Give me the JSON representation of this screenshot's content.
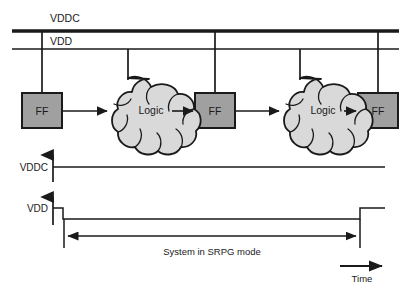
{
  "figure": {
    "colors": {
      "background": "#ffffff",
      "line": "#1a1a1a",
      "ff_fill": "#a0a0a0",
      "logic_fill": "#d9d9d9",
      "text": "#1a1a1a"
    }
  },
  "schematic": {
    "rails": [
      {
        "id": "vddc",
        "label": "VDDC",
        "style": "thick",
        "y": 31,
        "x1": 12,
        "x2": 399
      },
      {
        "id": "vdd",
        "label": "VDD",
        "style": "thin",
        "y": 49,
        "x1": 12,
        "x2": 399
      }
    ],
    "blocks": [
      {
        "id": "ff1",
        "type": "ff",
        "label": "FF",
        "supply": "VDDC",
        "x": 22,
        "y": 93
      },
      {
        "id": "logic1",
        "type": "logic",
        "label": "Logic",
        "supply": "VDD",
        "x": 90,
        "y": 80
      },
      {
        "id": "ff2",
        "type": "ff",
        "label": "FF",
        "supply": "VDDC",
        "x": 195,
        "y": 93
      },
      {
        "id": "logic2",
        "type": "logic",
        "label": "Logic",
        "supply": "VDD",
        "x": 262,
        "y": 80
      },
      {
        "id": "ff3",
        "type": "ff",
        "label": "FF",
        "supply": "VDDC",
        "x": 358,
        "y": 93
      }
    ],
    "signal_arrows": 4
  },
  "timing": {
    "traces": [
      {
        "id": "vddc-trace",
        "label": "VDDC",
        "shape": "constant-high",
        "description": "VDDC stays high for the entire time window"
      },
      {
        "id": "vdd-trace",
        "label": "VDD",
        "shape": "high-low-high",
        "description": "VDD is high, falls low during SRPG mode, then rises high again"
      }
    ],
    "span_label": "System in SRPG mode",
    "axis_label": "Time"
  }
}
